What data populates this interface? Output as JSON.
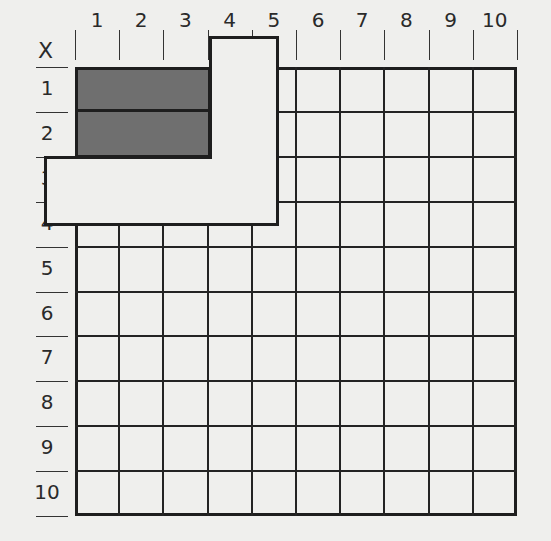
{
  "header": {
    "corner_label": "X"
  },
  "columns": [
    "1",
    "2",
    "3",
    "4",
    "5",
    "6",
    "7",
    "8",
    "9",
    "10"
  ],
  "rows": [
    "1",
    "2",
    "3",
    "4",
    "5",
    "6",
    "7",
    "8",
    "9",
    "10"
  ],
  "colors": {
    "background": "#efefed",
    "shaded": "#6f6f6f",
    "line": "#1e1e1e"
  },
  "shaded_cells": {
    "rows": [
      "1",
      "2"
    ],
    "columns": [
      "1",
      "2",
      "3"
    ]
  },
  "notes": {
    "overlay": "white L-shaped card covers column labels 4-5 and row labels 3-4"
  }
}
